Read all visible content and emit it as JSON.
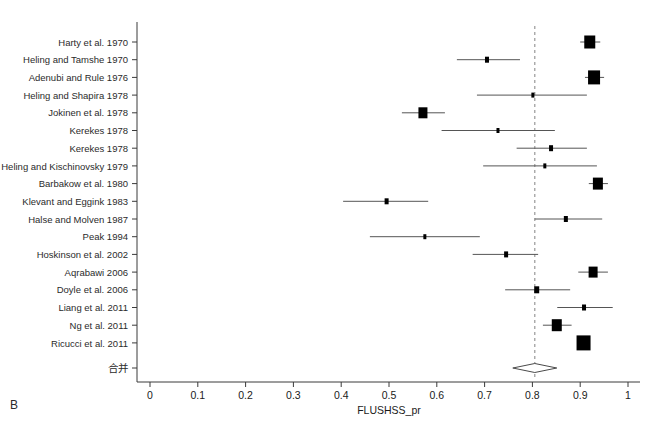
{
  "figure": {
    "panel_label": "B",
    "x_axis_title": "FLUSHSS_pr",
    "summary_row_label": "合并",
    "reference_line_value": 0.805,
    "colors": {
      "marker": "#000000",
      "line": "#555555",
      "axis": "#3a3a3a",
      "reference_dashed": "#999999",
      "background": "#ffffff"
    }
  },
  "chart_data": {
    "type": "scatter",
    "title": "",
    "subtitle": "",
    "xlabel": "FLUSHSS_pr",
    "ylabel": "",
    "xlim": [
      0,
      1
    ],
    "xticks": [
      0,
      0.1,
      0.2,
      0.3,
      0.4,
      0.5,
      0.6,
      0.7,
      0.8,
      0.9,
      1
    ],
    "xticklabels": [
      "0",
      "0.1",
      "0.2",
      "0.3",
      "0.4",
      "0.5",
      "0.6",
      "0.7",
      "0.8",
      "0.9",
      "1"
    ],
    "grid": false,
    "legend": "none",
    "reference_line": 0.805,
    "categories": [
      "Harty et al. 1970",
      "Heling and Tamshe 1970",
      "Adenubi and Rule 1976",
      "Heling and Shapira 1978",
      "Jokinen et al. 1978",
      "Kerekes 1978",
      "Kerekes 1978",
      "Heling and Kischinovsky 1979",
      "Barbakow et al. 1980",
      "Klevant and Eggink 1983",
      "Halse and Molven 1987",
      "Peak 1994",
      "Hoskinson et al. 2002",
      "Aqrabawi 2006",
      "Doyle et al. 2006",
      "Liang et al. 2011",
      "Ng et al. 2011",
      "Ricucci et al. 2011"
    ],
    "studies": [
      {
        "label": "Harty et al. 1970",
        "estimate": 0.92,
        "ci_low": 0.9,
        "ci_high": 0.942,
        "weight_box": 11
      },
      {
        "label": "Heling and Tamshe 1970",
        "estimate": 0.705,
        "ci_low": 0.642,
        "ci_high": 0.774,
        "weight_box": 4
      },
      {
        "label": "Adenubi and Rule 1976",
        "estimate": 0.929,
        "ci_low": 0.91,
        "ci_high": 0.95,
        "weight_box": 12
      },
      {
        "label": "Heling and Shapira 1978",
        "estimate": 0.801,
        "ci_low": 0.684,
        "ci_high": 0.914,
        "weight_box": 3
      },
      {
        "label": "Jokinen et al. 1978",
        "estimate": 0.571,
        "ci_low": 0.527,
        "ci_high": 0.617,
        "weight_box": 9
      },
      {
        "label": "Kerekes 1978",
        "estimate": 0.728,
        "ci_low": 0.61,
        "ci_high": 0.847,
        "weight_box": 3
      },
      {
        "label": "Kerekes 1978",
        "estimate": 0.839,
        "ci_low": 0.767,
        "ci_high": 0.914,
        "weight_box": 4
      },
      {
        "label": "Heling and Kischinovsky 1979",
        "estimate": 0.826,
        "ci_low": 0.697,
        "ci_high": 0.935,
        "weight_box": 3
      },
      {
        "label": "Barbakow et al. 1980",
        "estimate": 0.937,
        "ci_low": 0.918,
        "ci_high": 0.958,
        "weight_box": 10
      },
      {
        "label": "Klevant and Eggink 1983",
        "estimate": 0.495,
        "ci_low": 0.404,
        "ci_high": 0.582,
        "weight_box": 4
      },
      {
        "label": "Halse and Molven 1987",
        "estimate": 0.87,
        "ci_low": 0.805,
        "ci_high": 0.946,
        "weight_box": 4
      },
      {
        "label": "Peak 1994",
        "estimate": 0.575,
        "ci_low": 0.46,
        "ci_high": 0.69,
        "weight_box": 3
      },
      {
        "label": "Hoskinson et al. 2002",
        "estimate": 0.745,
        "ci_low": 0.675,
        "ci_high": 0.812,
        "weight_box": 4
      },
      {
        "label": "Aqrabawi 2006",
        "estimate": 0.927,
        "ci_low": 0.896,
        "ci_high": 0.958,
        "weight_box": 9
      },
      {
        "label": "Doyle et al. 2006",
        "estimate": 0.809,
        "ci_low": 0.743,
        "ci_high": 0.879,
        "weight_box": 5
      },
      {
        "label": "Liang et al. 2011",
        "estimate": 0.908,
        "ci_low": 0.852,
        "ci_high": 0.968,
        "weight_box": 4
      },
      {
        "label": "Ng et al. 2011",
        "estimate": 0.851,
        "ci_low": 0.822,
        "ci_high": 0.882,
        "weight_box": 10
      },
      {
        "label": "Ricucci et al. 2011",
        "estimate": 0.907,
        "ci_low": 0.9,
        "ci_high": 0.915,
        "weight_box": 14
      }
    ],
    "summary": {
      "label": "合并",
      "estimate": 0.805,
      "ci_low": 0.759,
      "ci_high": 0.851
    }
  }
}
